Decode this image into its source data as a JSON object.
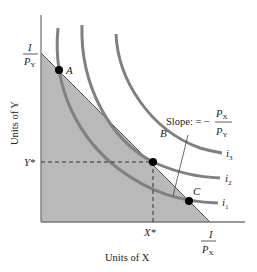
{
  "diagram": {
    "type": "consumer-choice-budget-constraint",
    "axes": {
      "x_label": "Units of X",
      "y_label": "Units of Y",
      "x_intercept": {
        "num": "I",
        "den": "P",
        "den_sub": "X"
      },
      "y_intercept": {
        "num": "I",
        "den": "P",
        "den_sub": "Y"
      },
      "x_star": "X*",
      "y_star": "Y*"
    },
    "points": [
      {
        "id": "A",
        "label": "A"
      },
      {
        "id": "B",
        "label": "B"
      },
      {
        "id": "C",
        "label": "C"
      }
    ],
    "curves": [
      {
        "id": "i1",
        "label": "i",
        "sub": "1"
      },
      {
        "id": "i2",
        "label": "i",
        "sub": "2"
      },
      {
        "id": "i3",
        "label": "i",
        "sub": "3"
      }
    ],
    "slope_annotation": {
      "prefix": "Slope: = −",
      "num": "P",
      "num_sub": "X",
      "den": "P",
      "den_sub": "Y"
    },
    "colors": {
      "shade": "#b8b8b8",
      "curve": "#7f7f7f",
      "axis": "#6e6e6e",
      "point": "#000000"
    }
  }
}
